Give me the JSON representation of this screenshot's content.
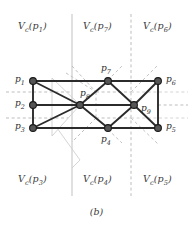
{
  "figure": {
    "caption": "(b)",
    "colors": {
      "vertex_fill": "#555555",
      "vertex_stroke": "#1a1a1a",
      "edge": "#2b2b2b",
      "voronoi_dashed": "#b9b9b9",
      "divider_solid": "#c9c9c9",
      "background": "#ffffff",
      "text": "#3a3a3a"
    }
  },
  "region_labels": [
    {
      "name": "region-label-vc-p1",
      "prefix": "V",
      "sub1": "c",
      "point": "p",
      "sub2": "1",
      "text": "Vc(p1)",
      "x": 18,
      "y": 20
    },
    {
      "name": "region-label-vc-p7",
      "prefix": "V",
      "sub1": "c",
      "point": "p",
      "sub2": "7",
      "text": "Vc(p7)",
      "x": 83,
      "y": 20
    },
    {
      "name": "region-label-vc-p6",
      "prefix": "V",
      "sub1": "c",
      "point": "p",
      "sub2": "6",
      "text": "Vc(p6)",
      "x": 143,
      "y": 20
    },
    {
      "name": "region-label-vc-p3",
      "prefix": "V",
      "sub1": "c",
      "point": "p",
      "sub2": "3",
      "text": "Vc(p3)",
      "x": 18,
      "y": 173
    },
    {
      "name": "region-label-vc-p4",
      "prefix": "V",
      "sub1": "c",
      "point": "p",
      "sub2": "4",
      "text": "Vc(p4)",
      "x": 83,
      "y": 173
    },
    {
      "name": "region-label-vc-p5",
      "prefix": "V",
      "sub1": "c",
      "point": "p",
      "sub2": "5",
      "text": "Vc(p5)",
      "x": 143,
      "y": 173
    }
  ],
  "vertices": [
    {
      "id": "p1",
      "label": "p",
      "sub": "1",
      "x": 33,
      "y": 81,
      "label_x": 15,
      "label_y": 74
    },
    {
      "id": "p2",
      "label": "p",
      "sub": "2",
      "x": 33,
      "y": 105,
      "label_x": 15,
      "label_y": 98
    },
    {
      "id": "p3",
      "label": "p",
      "sub": "3",
      "x": 33,
      "y": 128,
      "label_x": 15,
      "label_y": 121
    },
    {
      "id": "p4",
      "label": "p",
      "sub": "4",
      "x": 108,
      "y": 128,
      "label_x": 101,
      "label_y": 134
    },
    {
      "id": "p5",
      "label": "p",
      "sub": "5",
      "x": 158,
      "y": 128,
      "label_x": 166,
      "label_y": 121
    },
    {
      "id": "p6",
      "label": "p",
      "sub": "6",
      "x": 158,
      "y": 81,
      "label_x": 166,
      "label_y": 74
    },
    {
      "id": "p7",
      "label": "p",
      "sub": "7",
      "x": 108,
      "y": 81,
      "label_x": 101,
      "label_y": 63
    },
    {
      "id": "p8",
      "label": "p",
      "sub": "8",
      "x": 80,
      "y": 105,
      "label_x": 80,
      "label_y": 88
    },
    {
      "id": "p9",
      "label": "p",
      "sub": "9",
      "x": 134,
      "y": 105,
      "label_x": 141,
      "label_y": 103
    }
  ],
  "edges": [
    {
      "from": "p1",
      "to": "p2"
    },
    {
      "from": "p2",
      "to": "p3"
    },
    {
      "from": "p1",
      "to": "p7"
    },
    {
      "from": "p7",
      "to": "p6"
    },
    {
      "from": "p3",
      "to": "p4"
    },
    {
      "from": "p4",
      "to": "p5"
    },
    {
      "from": "p6",
      "to": "p5"
    },
    {
      "from": "p1",
      "to": "p8"
    },
    {
      "from": "p2",
      "to": "p8"
    },
    {
      "from": "p3",
      "to": "p8"
    },
    {
      "from": "p8",
      "to": "p7"
    },
    {
      "from": "p8",
      "to": "p4"
    },
    {
      "from": "p8",
      "to": "p9"
    },
    {
      "from": "p7",
      "to": "p9"
    },
    {
      "from": "p4",
      "to": "p9"
    },
    {
      "from": "p9",
      "to": "p6"
    },
    {
      "from": "p9",
      "to": "p5"
    }
  ],
  "voronoi_boundaries": {
    "divider_solid_x": 72,
    "divider_dashed_x": 131,
    "horizontal_left_y": [
      92,
      118
    ],
    "horizontal_right_y": 105
  }
}
